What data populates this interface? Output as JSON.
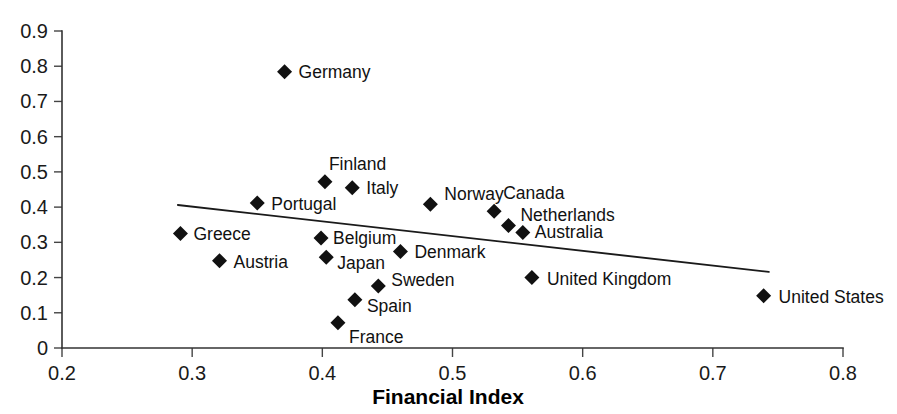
{
  "chart_data": {
    "type": "scatter",
    "title": "",
    "xlabel": "Financial Index",
    "ylabel": "",
    "xlim": [
      0.2,
      0.8
    ],
    "ylim": [
      0.0,
      0.9
    ],
    "grid": false,
    "legend": "none",
    "xticks": [
      "0.2",
      "0.3",
      "0.4",
      "0.5",
      "0.6",
      "0.7",
      "0.8"
    ],
    "xtick_values": [
      0.2,
      0.3,
      0.4,
      0.5,
      0.6,
      0.7,
      0.8
    ],
    "yticks": [
      "0",
      "0.1",
      "0.2",
      "0.3",
      "0.4",
      "0.5",
      "0.6",
      "0.7",
      "0.8",
      "0.9"
    ],
    "ytick_values": [
      0.0,
      0.1,
      0.2,
      0.3,
      0.4,
      0.5,
      0.6,
      0.7,
      0.8,
      0.9
    ],
    "marker_shape": "diamond",
    "marker_color": "#111111",
    "trendline": {
      "label": "fitted-trend-line",
      "color": "#1a1a1a",
      "x": [
        0.289,
        0.743
      ],
      "y": [
        0.406,
        0.216
      ]
    },
    "points": [
      {
        "label": "Germany",
        "x": 0.371,
        "y": 0.784,
        "label_dx": 14,
        "label_dy": 6
      },
      {
        "label": "Finland",
        "x": 0.402,
        "y": 0.472,
        "label_dx": 4,
        "label_dy": -12
      },
      {
        "label": "Italy",
        "x": 0.423,
        "y": 0.455,
        "label_dx": 14,
        "label_dy": 6
      },
      {
        "label": "Norway",
        "x": 0.483,
        "y": 0.408,
        "label_dx": 14,
        "label_dy": -4
      },
      {
        "label": "Portugal",
        "x": 0.35,
        "y": 0.412,
        "label_dx": 14,
        "label_dy": 7
      },
      {
        "label": "Canada",
        "x": 0.532,
        "y": 0.388,
        "label_dx": 9,
        "label_dy": -12
      },
      {
        "label": "Netherlands",
        "x": 0.543,
        "y": 0.348,
        "label_dx": 12,
        "label_dy": -4
      },
      {
        "label": "Australia",
        "x": 0.554,
        "y": 0.328,
        "label_dx": 12,
        "label_dy": 6
      },
      {
        "label": "Greece",
        "x": 0.291,
        "y": 0.325,
        "label_dx": 13,
        "label_dy": 6
      },
      {
        "label": "Belgium",
        "x": 0.399,
        "y": 0.312,
        "label_dx": 12,
        "label_dy": 6
      },
      {
        "label": "Japan",
        "x": 0.403,
        "y": 0.258,
        "label_dx": 11,
        "label_dy": 12
      },
      {
        "label": "Denmark",
        "x": 0.46,
        "y": 0.274,
        "label_dx": 14,
        "label_dy": 7
      },
      {
        "label": "Austria",
        "x": 0.321,
        "y": 0.248,
        "label_dx": 14,
        "label_dy": 7
      },
      {
        "label": "United Kingdom",
        "x": 0.561,
        "y": 0.2,
        "label_dx": 15,
        "label_dy": 7
      },
      {
        "label": "Sweden",
        "x": 0.443,
        "y": 0.176,
        "label_dx": 13,
        "label_dy": 0
      },
      {
        "label": "Spain",
        "x": 0.425,
        "y": 0.137,
        "label_dx": 12,
        "label_dy": 12
      },
      {
        "label": "France",
        "x": 0.412,
        "y": 0.072,
        "label_dx": 11,
        "label_dy": 20
      },
      {
        "label": "United States",
        "x": 0.739,
        "y": 0.148,
        "label_dx": 15,
        "label_dy": 7
      }
    ]
  },
  "axis_titles": {
    "x": "Financial Index"
  }
}
